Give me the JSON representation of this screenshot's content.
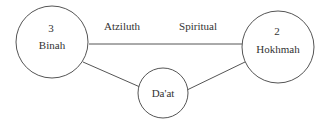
{
  "diagram": {
    "nodes": [
      {
        "id": "binah",
        "number": "3",
        "name": "Binah"
      },
      {
        "id": "hokhmah",
        "number": "2",
        "name": "Hokhmah"
      },
      {
        "id": "daat",
        "name": "Da'at"
      }
    ],
    "edge_labels": {
      "left": "Atziluth",
      "right": "Spiritual"
    },
    "colors": {
      "stroke": "#555555",
      "text": "#333333",
      "background": "#ffffff"
    }
  }
}
